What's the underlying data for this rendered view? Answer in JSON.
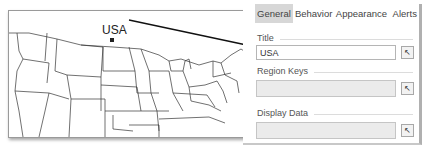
{
  "map": {
    "region_label": "USA",
    "marker_icon": "square-marker-icon"
  },
  "panel": {
    "tabs": [
      {
        "label": "General",
        "active": true
      },
      {
        "label": "Behavior",
        "active": false
      },
      {
        "label": "Appearance",
        "active": false
      },
      {
        "label": "Alerts",
        "active": false
      }
    ],
    "title_section": {
      "label": "Title",
      "value": "USA"
    },
    "region_keys_section": {
      "label": "Region Keys",
      "value": ""
    },
    "display_data_section": {
      "label": "Display Data",
      "value": ""
    },
    "picker_icon": "cursor-pick-icon"
  },
  "colors": {
    "active_tab_bg": "#d7d7d7",
    "connector_line": "#111111",
    "map_lines": "#333333"
  }
}
